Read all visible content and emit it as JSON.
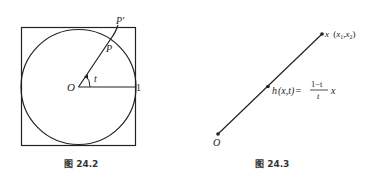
{
  "figures": [
    {
      "caption": "图 24.2",
      "labels": {
        "origin": "O",
        "angle": "t",
        "point_on_circle": "P",
        "point_on_square": "P′",
        "radius_value": "1"
      }
    },
    {
      "caption": "图 24.3",
      "labels": {
        "origin": "O",
        "endpoint": "x",
        "endpoint_coords_open": "(",
        "endpoint_x1": "x",
        "endpoint_x1_sub": "1",
        "endpoint_comma": ",",
        "endpoint_x2": "x",
        "endpoint_x2_sub": "2",
        "endpoint_coords_close": ")",
        "midpoint_func": "h",
        "midpoint_args": "(x,t)",
        "equals": "=",
        "frac_num": "1−t",
        "frac_den": "t",
        "frac_tail": "x"
      }
    }
  ],
  "colors": {
    "stroke": "#222222",
    "text": "#222222"
  }
}
